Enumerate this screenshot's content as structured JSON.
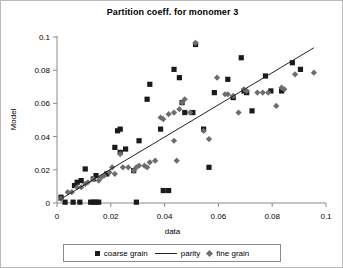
{
  "chart_data": {
    "type": "scatter",
    "title": "Partition coeff. for monomer 3",
    "xlabel": "data",
    "ylabel": "Model",
    "xlim": [
      0,
      0.1
    ],
    "ylim": [
      0,
      0.1
    ],
    "xticks": [
      "0",
      "0.02",
      "0.04",
      "0.06",
      "0.08",
      "0.1"
    ],
    "yticks": [
      "0",
      "0.02",
      "0.04",
      "0.06",
      "0.08",
      "0.1"
    ],
    "xtick_values": [
      0,
      0.02,
      0.04,
      0.06,
      0.08,
      0.1
    ],
    "ytick_values": [
      0,
      0.02,
      0.04,
      0.06,
      0.08,
      0.1
    ],
    "grid": false,
    "legend_position": "bottom",
    "legend": [
      {
        "label": "coarse grain",
        "marker": "square",
        "color": "#1a1a1a"
      },
      {
        "label": "parity",
        "marker": "line",
        "color": "#222222"
      },
      {
        "label": "fine grain",
        "marker": "diamond",
        "color": "#6d6d6d"
      }
    ],
    "series": [
      {
        "name": "coarse grain",
        "marker": "square",
        "color": "#1a1a1a",
        "points": [
          [
            0.0015,
            0.0035
          ],
          [
            0.003,
            0.0005
          ],
          [
            0.006,
            0.0005
          ],
          [
            0.0065,
            0.0105
          ],
          [
            0.0075,
            0.0125
          ],
          [
            0.0085,
            0.0005
          ],
          [
            0.009,
            0.0135
          ],
          [
            0.0125,
            0.0005
          ],
          [
            0.0135,
            0.0005
          ],
          [
            0.0145,
            0.0005
          ],
          [
            0.0155,
            0.0005
          ],
          [
            0.0105,
            0.0205
          ],
          [
            0.0135,
            0.0145
          ],
          [
            0.0145,
            0.0165
          ],
          [
            0.0185,
            0.0175
          ],
          [
            0.0215,
            0.0335
          ],
          [
            0.0225,
            0.0435
          ],
          [
            0.0235,
            0.0445
          ],
          [
            0.0235,
            0.0305
          ],
          [
            0.0255,
            0.0325
          ],
          [
            0.0285,
            0.0195
          ],
          [
            0.0295,
            0.0005
          ],
          [
            0.0305,
            0.0375
          ],
          [
            0.0335,
            0.0625
          ],
          [
            0.0345,
            0.0715
          ],
          [
            0.0395,
            0.0075
          ],
          [
            0.0415,
            0.0075
          ],
          [
            0.0385,
            0.0445
          ],
          [
            0.0435,
            0.0805
          ],
          [
            0.0455,
            0.0755
          ],
          [
            0.0465,
            0.0605
          ],
          [
            0.0475,
            0.0545
          ],
          [
            0.0505,
            0.0545
          ],
          [
            0.0515,
            0.0955
          ],
          [
            0.0545,
            0.0445
          ],
          [
            0.0565,
            0.0215
          ],
          [
            0.0585,
            0.0665
          ],
          [
            0.0635,
            0.0745
          ],
          [
            0.0655,
            0.0635
          ],
          [
            0.0685,
            0.0875
          ],
          [
            0.0695,
            0.0675
          ],
          [
            0.0705,
            0.0665
          ],
          [
            0.0725,
            0.0555
          ],
          [
            0.0775,
            0.0765
          ],
          [
            0.0795,
            0.0675
          ],
          [
            0.0835,
            0.0675
          ],
          [
            0.0875,
            0.0845
          ],
          [
            0.0905,
            0.0805
          ]
        ]
      },
      {
        "name": "fine grain",
        "marker": "diamond",
        "color": "#6d6d6d",
        "points": [
          [
            0.0015,
            0.0025
          ],
          [
            0.004,
            0.0065
          ],
          [
            0.0055,
            0.0065
          ],
          [
            0.0075,
            0.0095
          ],
          [
            0.009,
            0.0095
          ],
          [
            0.0105,
            0.0115
          ],
          [
            0.0115,
            0.0125
          ],
          [
            0.0135,
            0.0145
          ],
          [
            0.0155,
            0.0135
          ],
          [
            0.0165,
            0.0155
          ],
          [
            0.0175,
            0.0165
          ],
          [
            0.0195,
            0.0185
          ],
          [
            0.0205,
            0.0215
          ],
          [
            0.0215,
            0.0175
          ],
          [
            0.0235,
            0.0295
          ],
          [
            0.0245,
            0.0215
          ],
          [
            0.0265,
            0.0215
          ],
          [
            0.0285,
            0.0195
          ],
          [
            0.0295,
            0.0215
          ],
          [
            0.0305,
            0.0225
          ],
          [
            0.0325,
            0.0225
          ],
          [
            0.0335,
            0.0215
          ],
          [
            0.0345,
            0.0245
          ],
          [
            0.0365,
            0.0255
          ],
          [
            0.0385,
            0.0515
          ],
          [
            0.0395,
            0.0505
          ],
          [
            0.0415,
            0.0535
          ],
          [
            0.0435,
            0.0545
          ],
          [
            0.0455,
            0.0565
          ],
          [
            0.0435,
            0.0375
          ],
          [
            0.0445,
            0.0255
          ],
          [
            0.0465,
            0.0605
          ],
          [
            0.0475,
            0.0625
          ],
          [
            0.0495,
            0.0545
          ],
          [
            0.0515,
            0.0965
          ],
          [
            0.0545,
            0.0435
          ],
          [
            0.0565,
            0.0385
          ],
          [
            0.0595,
            0.0755
          ],
          [
            0.0625,
            0.0655
          ],
          [
            0.0635,
            0.0655
          ],
          [
            0.0655,
            0.0645
          ],
          [
            0.0675,
            0.0545
          ],
          [
            0.0695,
            0.0685
          ],
          [
            0.0705,
            0.0675
          ],
          [
            0.0745,
            0.0665
          ],
          [
            0.0765,
            0.0665
          ],
          [
            0.0785,
            0.0665
          ],
          [
            0.0815,
            0.0585
          ],
          [
            0.0835,
            0.0695
          ],
          [
            0.0845,
            0.0685
          ],
          [
            0.0885,
            0.0775
          ],
          [
            0.0955,
            0.0785
          ]
        ]
      },
      {
        "name": "parity",
        "marker": "line",
        "color": "#222222",
        "points": [
          [
            0.0005,
            0.0015
          ],
          [
            0.0955,
            0.0935
          ]
        ]
      }
    ]
  },
  "figure": {
    "background": "#ffffff",
    "border_color": "#b9b9b9"
  }
}
